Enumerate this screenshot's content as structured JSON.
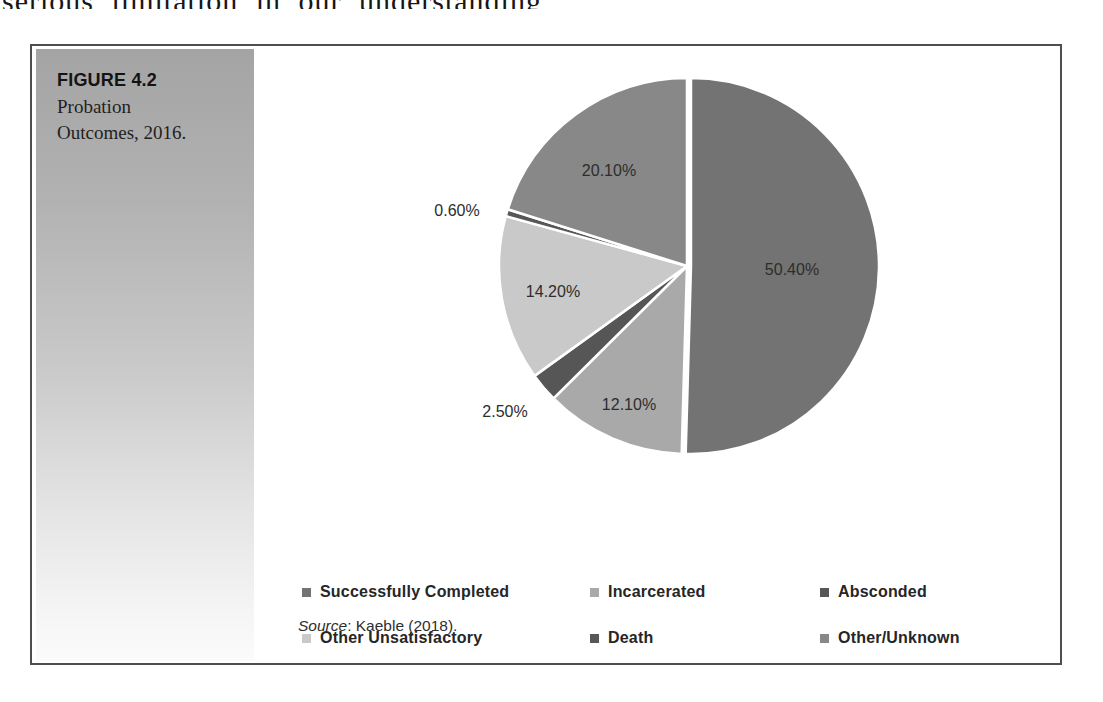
{
  "page": {
    "top_text_fragment": "serious limitation in our understanding"
  },
  "figure": {
    "label": "FIGURE 4.2",
    "caption_line1": "Probation",
    "caption_line2": "Outcomes, 2016.",
    "source_label": "Source",
    "source_rest": ": Kaeble (2018)."
  },
  "chart_data": {
    "type": "pie",
    "title": "Probation Outcomes, 2016",
    "legend_position": "bottom",
    "start_angle_deg": 0,
    "direction": "clockwise",
    "slices": [
      {
        "name": "Successfully Completed",
        "value": 50.4,
        "label": "50.40%",
        "color": "#737373",
        "label_x": 370,
        "label_y": 199,
        "explode": 4
      },
      {
        "name": "Incarcerated",
        "value": 12.1,
        "label": "12.10%",
        "color": "#a9a9a9",
        "label_x": 207,
        "label_y": 334,
        "explode": 0
      },
      {
        "name": "Absconded",
        "value": 2.5,
        "label": "2.50%",
        "color": "#565656",
        "label_x": 83,
        "label_y": 341,
        "explode": 0
      },
      {
        "name": "Other Unsatisfactory",
        "value": 14.2,
        "label": "14.20%",
        "color": "#c9c9c9",
        "label_x": 131,
        "label_y": 221,
        "explode": 0
      },
      {
        "name": "Death",
        "value": 0.6,
        "label": "0.60%",
        "color": "#575757",
        "label_x": 35,
        "label_y": 140,
        "explode": 0
      },
      {
        "name": "Other/Unknown",
        "value": 20.1,
        "label": "20.10%",
        "color": "#888888",
        "label_x": 187,
        "label_y": 100,
        "explode": 0
      }
    ],
    "legend_rows": [
      [
        "Successfully Completed",
        "Incarcerated",
        "Absconded"
      ],
      [
        "Other Unsatisfactory",
        "Death",
        "Other/Unknown"
      ]
    ]
  }
}
